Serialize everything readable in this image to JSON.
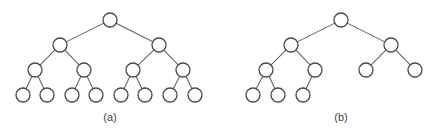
{
  "figure": {
    "stroke_color": "#4a4a4a",
    "edge_color": "#666666",
    "node_radius": 7,
    "trees": [
      {
        "id": "a",
        "label": "(a)",
        "label_x": 110,
        "description": "complete binary tree with 15 nodes (4 levels)",
        "nodes": [
          {
            "id": "a0",
            "x": 110,
            "y": 20
          },
          {
            "id": "a1",
            "x": 60,
            "y": 45
          },
          {
            "id": "a2",
            "x": 159,
            "y": 45
          },
          {
            "id": "a3",
            "x": 35,
            "y": 70
          },
          {
            "id": "a4",
            "x": 84,
            "y": 70
          },
          {
            "id": "a5",
            "x": 133,
            "y": 70
          },
          {
            "id": "a6",
            "x": 183,
            "y": 70
          },
          {
            "id": "a7",
            "x": 23,
            "y": 95
          },
          {
            "id": "a8",
            "x": 47,
            "y": 95
          },
          {
            "id": "a9",
            "x": 72,
            "y": 95
          },
          {
            "id": "a10",
            "x": 96,
            "y": 95
          },
          {
            "id": "a11",
            "x": 121,
            "y": 95
          },
          {
            "id": "a12",
            "x": 145,
            "y": 95
          },
          {
            "id": "a13",
            "x": 170,
            "y": 95
          },
          {
            "id": "a14",
            "x": 195,
            "y": 95
          }
        ],
        "edges": [
          [
            "a0",
            "a1"
          ],
          [
            "a0",
            "a2"
          ],
          [
            "a1",
            "a3"
          ],
          [
            "a1",
            "a4"
          ],
          [
            "a2",
            "a5"
          ],
          [
            "a2",
            "a6"
          ],
          [
            "a3",
            "a7"
          ],
          [
            "a3",
            "a8"
          ],
          [
            "a4",
            "a9"
          ],
          [
            "a4",
            "a10"
          ],
          [
            "a5",
            "a11"
          ],
          [
            "a5",
            "a12"
          ],
          [
            "a6",
            "a13"
          ],
          [
            "a6",
            "a14"
          ]
        ]
      },
      {
        "id": "b",
        "label": "(b)",
        "label_x": 341,
        "description": "complete (not full) binary tree with 10 nodes",
        "nodes": [
          {
            "id": "b0",
            "x": 341,
            "y": 20
          },
          {
            "id": "b1",
            "x": 291,
            "y": 45
          },
          {
            "id": "b2",
            "x": 391,
            "y": 45
          },
          {
            "id": "b3",
            "x": 266,
            "y": 70
          },
          {
            "id": "b4",
            "x": 315,
            "y": 70
          },
          {
            "id": "b5",
            "x": 366,
            "y": 70
          },
          {
            "id": "b6",
            "x": 415,
            "y": 70
          },
          {
            "id": "b7",
            "x": 253,
            "y": 95
          },
          {
            "id": "b8",
            "x": 278,
            "y": 95
          },
          {
            "id": "b9",
            "x": 303,
            "y": 95
          }
        ],
        "edges": [
          [
            "b0",
            "b1"
          ],
          [
            "b0",
            "b2"
          ],
          [
            "b1",
            "b3"
          ],
          [
            "b1",
            "b4"
          ],
          [
            "b2",
            "b5"
          ],
          [
            "b2",
            "b6"
          ],
          [
            "b3",
            "b7"
          ],
          [
            "b3",
            "b8"
          ],
          [
            "b4",
            "b9"
          ]
        ]
      }
    ]
  }
}
